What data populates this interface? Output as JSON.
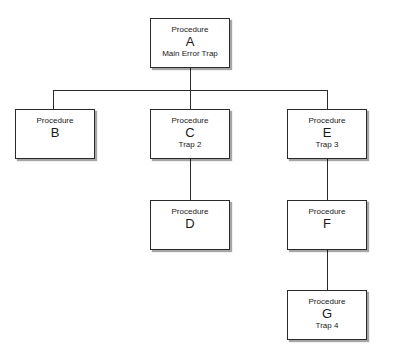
{
  "diagram": {
    "type": "hierarchy",
    "nodes": [
      {
        "id": "A",
        "kind": "Procedure",
        "letter": "A",
        "sub": "Main Error Trap"
      },
      {
        "id": "B",
        "kind": "Procedure",
        "letter": "B",
        "sub": ""
      },
      {
        "id": "C",
        "kind": "Procedure",
        "letter": "C",
        "sub": "Trap 2"
      },
      {
        "id": "E",
        "kind": "Procedure",
        "letter": "E",
        "sub": "Trap 3"
      },
      {
        "id": "D",
        "kind": "Procedure",
        "letter": "D",
        "sub": ""
      },
      {
        "id": "F",
        "kind": "Procedure",
        "letter": "F",
        "sub": ""
      },
      {
        "id": "G",
        "kind": "Procedure",
        "letter": "G",
        "sub": "Trap 4"
      }
    ],
    "edges": [
      [
        "A",
        "B"
      ],
      [
        "A",
        "C"
      ],
      [
        "A",
        "E"
      ],
      [
        "C",
        "D"
      ],
      [
        "E",
        "F"
      ],
      [
        "F",
        "G"
      ]
    ]
  }
}
